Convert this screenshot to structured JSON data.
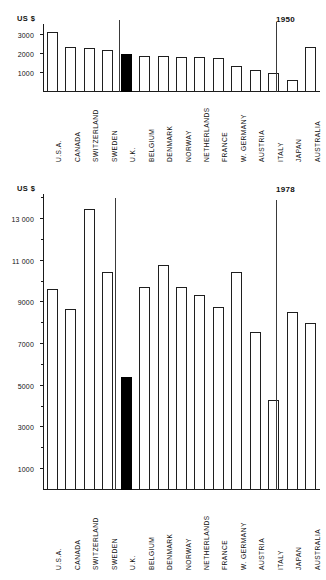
{
  "figure": {
    "unit_label": "US $",
    "countries": [
      "U.S.A.",
      "CANADA",
      "SWITZERLAND",
      "SWEDEN",
      "U.K.",
      "BELGIUM",
      "DENMARK",
      "NORWAY",
      "NETHERLANDS",
      "FRANCE",
      "W. GERMANY",
      "AUSTRIA",
      "ITALY",
      "JAPAN",
      "AUSTRALIA"
    ],
    "highlight_country": "U.K.",
    "highlight_color": "#000000",
    "bar_color": "#ffffff",
    "bar_border_color": "#1f1f1f"
  },
  "chart_data": [
    {
      "type": "bar",
      "title": "1950",
      "xlabel": "",
      "ylabel": "US $",
      "ylim": [
        0,
        3600
      ],
      "yticks": [
        1000,
        2000,
        3000
      ],
      "ytick_labels": [
        "1000",
        "2000",
        "3000"
      ],
      "grid": false,
      "legend": "none",
      "categories": [
        "U.S.A.",
        "CANADA",
        "SWITZERLAND",
        "SWEDEN",
        "U.K.",
        "BELGIUM",
        "DENMARK",
        "NORWAY",
        "NETHERLANDS",
        "FRANCE",
        "W. GERMANY",
        "AUSTRIA",
        "ITALY",
        "JAPAN",
        "AUSTRALIA"
      ],
      "values": [
        3200,
        2380,
        2330,
        2240,
        2000,
        1910,
        1900,
        1850,
        1860,
        1780,
        1370,
        1180,
        990,
        650,
        2380
      ],
      "highlighted": [
        "U.K."
      ],
      "annotations": [
        "vertical spike artifact between CANADA and SWITZERLAND",
        "vertical spike artifact between ITALY and JAPAN"
      ]
    },
    {
      "type": "bar",
      "title": "1978",
      "xlabel": "",
      "ylabel": "US $",
      "ylim": [
        0,
        14200
      ],
      "yticks": [
        1000,
        3000,
        5000,
        7000,
        9000,
        11000,
        13000
      ],
      "ytick_labels": [
        "1000",
        "3000",
        "5000",
        "7000",
        "9000",
        "11 000",
        "13 000"
      ],
      "minor_yticks": [
        2000,
        4000,
        6000,
        8000,
        10000,
        12000,
        14000
      ],
      "grid": false,
      "legend": "none",
      "categories": [
        "U.S.A.",
        "CANADA",
        "SWITZERLAND",
        "SWEDEN",
        "U.K.",
        "BELGIUM",
        "DENMARK",
        "NORWAY",
        "NETHERLANDS",
        "FRANCE",
        "W. GERMANY",
        "AUSTRIA",
        "ITALY",
        "JAPAN",
        "AUSTRALIA"
      ],
      "values": [
        9650,
        8700,
        13500,
        10450,
        5400,
        9750,
        10800,
        9750,
        9350,
        8800,
        10450,
        7600,
        4300,
        8550,
        8000
      ],
      "highlighted": [
        "U.K."
      ],
      "annotations": [
        "vertical spike artifact between ITALY and JAPAN"
      ]
    }
  ]
}
